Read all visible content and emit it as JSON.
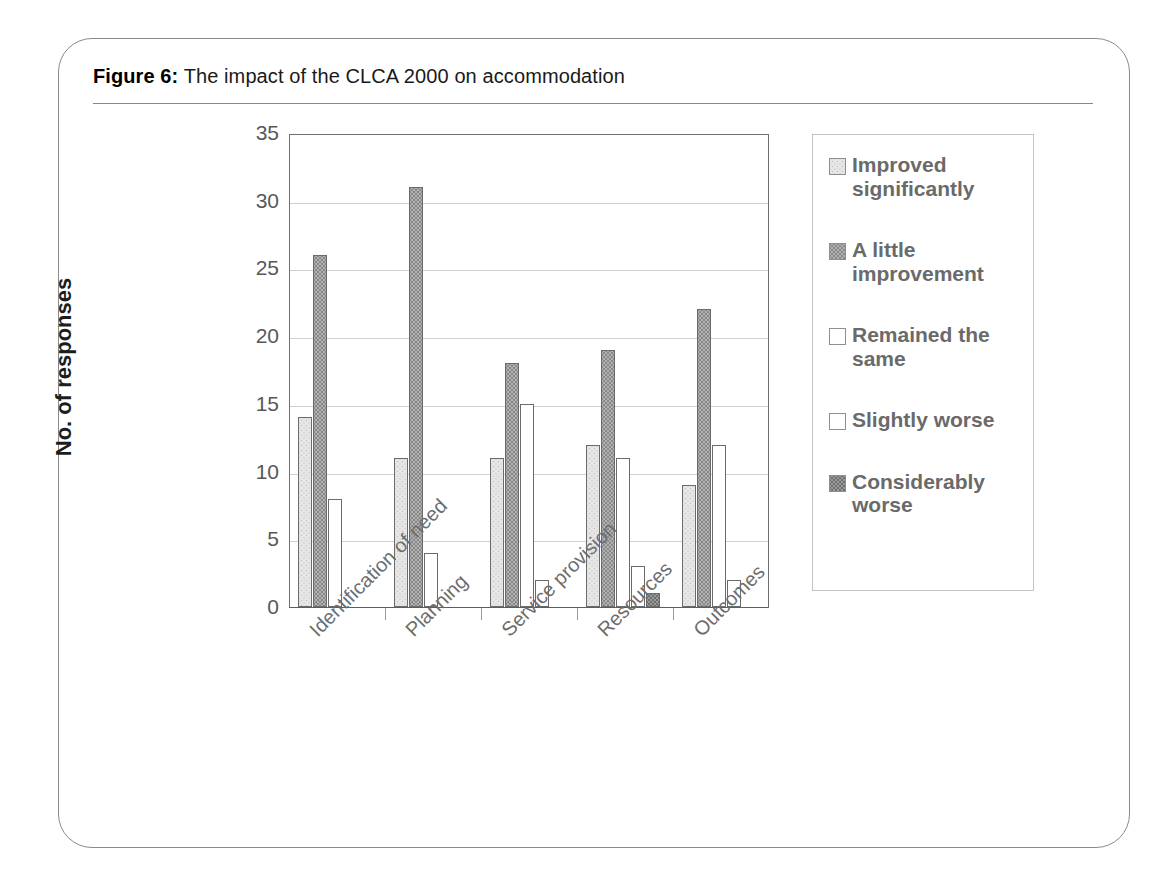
{
  "figure": {
    "label": "Figure 6:",
    "caption": "The impact of the CLCA 2000 on accommodation"
  },
  "chart_data": {
    "type": "bar",
    "title": "The impact of the CLCA 2000 on accommodation",
    "xlabel": "",
    "ylabel": "No. of responses",
    "ylim": [
      0,
      35
    ],
    "yticks": [
      0,
      5,
      10,
      15,
      20,
      25,
      30,
      35
    ],
    "grid": true,
    "legend_position": "right",
    "categories": [
      "Identification of need",
      "Planning",
      "Service provision",
      "Resources",
      "Outcomes"
    ],
    "series": [
      {
        "name": "Improved significantly",
        "color": "#e6e6e6",
        "values": [
          14,
          11,
          11,
          12,
          9
        ]
      },
      {
        "name": "A little improvement",
        "color": "#b0b0b0",
        "values": [
          26,
          31,
          18,
          19,
          22
        ]
      },
      {
        "name": "Remained the same",
        "color": "#ffffff",
        "values": [
          8,
          4,
          15,
          11,
          12
        ]
      },
      {
        "name": "Slightly worse",
        "color": "#ffffff",
        "values": [
          0,
          0,
          2,
          3,
          2
        ]
      },
      {
        "name": "Considerably worse",
        "color": "#9a9a9a",
        "values": [
          0,
          0,
          0,
          1,
          0
        ]
      }
    ]
  },
  "legend": {
    "items": [
      {
        "label": "Improved significantly"
      },
      {
        "label": "A little improvement"
      },
      {
        "label": "Remained the same"
      },
      {
        "label": "Slightly worse"
      },
      {
        "label": "Considerably worse"
      }
    ]
  }
}
